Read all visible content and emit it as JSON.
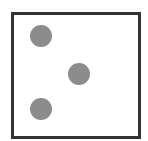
{
  "figure": {
    "type": "dice-face",
    "pip_count": 3,
    "frame": {
      "border_color": "#333333",
      "fill_color": "#ffffff"
    },
    "pip_color": "#8c8c8c",
    "pips": [
      {
        "cx": 41,
        "cy": 36,
        "diameter": 22
      },
      {
        "cx": 79,
        "cy": 74,
        "diameter": 22
      },
      {
        "cx": 41,
        "cy": 109,
        "diameter": 22
      }
    ]
  }
}
